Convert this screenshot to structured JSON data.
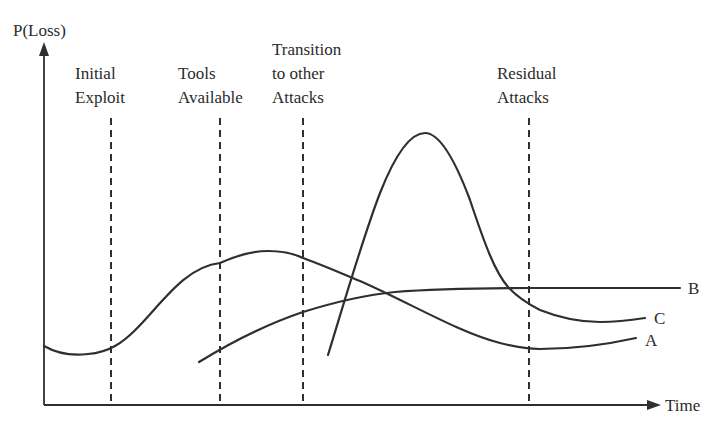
{
  "diagram": {
    "y_axis_label": "P(Loss)",
    "x_axis_label": "Time",
    "phases": [
      {
        "line1": "Initial",
        "line2": "Exploit"
      },
      {
        "line1": "Tools",
        "line2": "Available"
      },
      {
        "line1": "Transition",
        "line2": "to other",
        "line3": "Attacks"
      },
      {
        "line1": "Residual",
        "line2": "Attacks"
      }
    ],
    "curves": [
      {
        "label": "A",
        "description": "Gradual rise to a broad peak between Tools Available and Transition, then decline to a low level"
      },
      {
        "label": "B",
        "description": "Starts near Tools Available, rises and levels off to a high plateau"
      },
      {
        "label": "C",
        "description": "Starts after Transition, sharp tall peak, then falls to a moderate level before Residual Attacks"
      }
    ],
    "colors": {
      "line": "#2f2f2f",
      "text": "#2b2b2b",
      "background": "#ffffff"
    }
  }
}
